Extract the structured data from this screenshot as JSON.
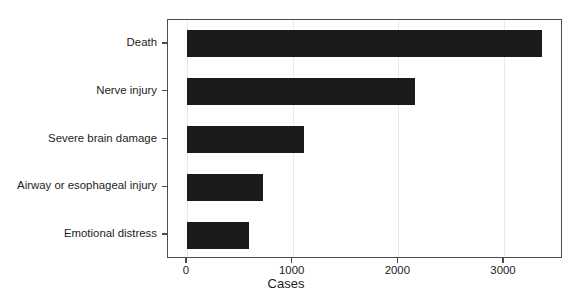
{
  "chart_data": {
    "type": "bar",
    "orientation": "horizontal",
    "title": "",
    "xlabel": "Cases",
    "ylabel": "",
    "categories": [
      "Death",
      "Nerve injury",
      "Severe brain damage",
      "Airway or esophageal injury",
      "Emotional distress"
    ],
    "values": [
      3360,
      2160,
      1110,
      720,
      590
    ],
    "xlim": [
      -180,
      3560
    ],
    "xticks": [
      0,
      1000,
      2000,
      3000
    ],
    "xticklabels": [
      "0",
      "1000",
      "2000",
      "3000"
    ],
    "grid": "vertical-only",
    "legend": "none",
    "bar_color": "#1b1b1b",
    "grid_color": "#e9e9e9",
    "axis_color": "#4d4d4d",
    "background_color": "#ffffff"
  }
}
